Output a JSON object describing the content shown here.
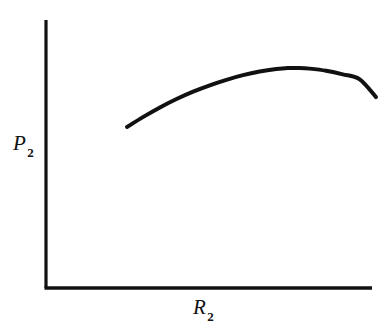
{
  "figure": {
    "background_color": "#ffffff",
    "ink_color": "#111111",
    "width": 389,
    "height": 328
  },
  "axes": {
    "y_axis": {
      "name": "y-axis-line",
      "symbol": "P",
      "subscript": "2",
      "label_text": "P2"
    },
    "x_axis": {
      "name": "x-axis-line",
      "symbol": "R",
      "subscript": "2",
      "label_text": "R2"
    }
  },
  "chart_data": {
    "type": "line",
    "title": "",
    "subtitle": "",
    "xlabel": "R_2",
    "ylabel": "P_2",
    "grid": false,
    "legend": null,
    "annotations": [],
    "axis_ticks": {
      "x": [],
      "y": []
    },
    "xlim": [
      0,
      1
    ],
    "ylim": [
      0,
      1
    ],
    "series": [
      {
        "name": "P2 response curve",
        "color": "#111111",
        "line_width": 4,
        "shape": "concave-down arc",
        "x": [
          0.251,
          0.3,
          0.35,
          0.4,
          0.45,
          0.5,
          0.55,
          0.6,
          0.65,
          0.7,
          0.735,
          0.77,
          0.8,
          0.85,
          0.9,
          0.95,
          1.0
        ],
        "y": [
          0.602,
          0.65,
          0.695,
          0.735,
          0.77,
          0.8,
          0.826,
          0.848,
          0.865,
          0.877,
          0.882,
          0.882,
          0.879,
          0.869,
          0.852,
          0.829,
          0.744
        ],
        "peak": {
          "x": 0.752,
          "y": 0.882
        },
        "start_point": {
          "x": 0.251,
          "y": 0.602
        },
        "end_point": {
          "x": 1.0,
          "y": 0.744
        }
      }
    ],
    "pixel_geometry": {
      "origin": {
        "x": 46,
        "y": 288
      },
      "y_axis_top": {
        "x": 46,
        "y": 20
      },
      "x_axis_right": {
        "x": 372,
        "y": 288
      },
      "curve_start_px": {
        "x": 127,
        "y": 127
      },
      "curve_peak_px": {
        "x": 286,
        "y": 68
      },
      "curve_end_px": {
        "x": 376,
        "y": 89
      }
    }
  }
}
